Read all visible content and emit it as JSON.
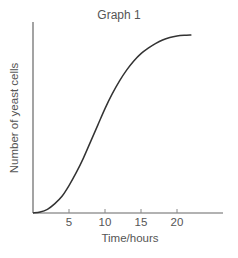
{
  "chart_data": {
    "type": "line",
    "title": "Graph 1",
    "xlabel": "Time/hours",
    "ylabel": "Number of yeast cells",
    "x_ticks": [
      5,
      10,
      15,
      20
    ],
    "x_tick_labels": [
      "5",
      "10",
      "15",
      "20"
    ],
    "y_ticks": [],
    "xlim": [
      0,
      26
    ],
    "ylim": [
      0,
      1
    ],
    "grid": false,
    "legend": null,
    "series": [
      {
        "name": "Yeast population (sigmoid growth curve)",
        "color": "#333333",
        "x": [
          0,
          1,
          2,
          3,
          4,
          5,
          6,
          7,
          8,
          9,
          10,
          11,
          12,
          13,
          14,
          15,
          16,
          17,
          18,
          19,
          20,
          21,
          22
        ],
        "y": [
          0.0,
          0.005,
          0.02,
          0.05,
          0.09,
          0.15,
          0.22,
          0.3,
          0.39,
          0.48,
          0.57,
          0.65,
          0.72,
          0.78,
          0.83,
          0.87,
          0.9,
          0.925,
          0.945,
          0.958,
          0.966,
          0.97,
          0.972
        ]
      }
    ],
    "annotations": []
  }
}
